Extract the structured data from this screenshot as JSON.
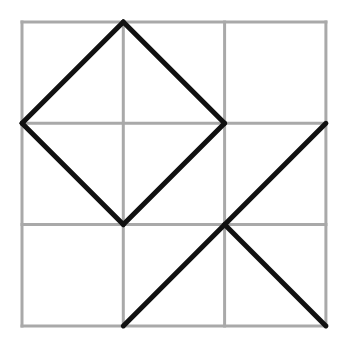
{
  "diagram": {
    "title": "",
    "grid": {
      "rows": 3,
      "cols": 3,
      "line_color": "#a9a9a9"
    },
    "segment_color": "#111111",
    "segments_grid_units": [
      {
        "name": "diamond-edge-top-left",
        "from": [
          0,
          1
        ],
        "to": [
          1,
          0
        ]
      },
      {
        "name": "diamond-edge-top-right",
        "from": [
          1,
          0
        ],
        "to": [
          2,
          1
        ]
      },
      {
        "name": "diamond-edge-bottom-right",
        "from": [
          2,
          1
        ],
        "to": [
          1,
          2
        ]
      },
      {
        "name": "diamond-edge-bottom-left",
        "from": [
          1,
          2
        ],
        "to": [
          0,
          1
        ]
      },
      {
        "name": "long-diagonal",
        "from": [
          1,
          3
        ],
        "to": [
          3,
          1
        ]
      },
      {
        "name": "short-diagonal",
        "from": [
          2,
          2
        ],
        "to": [
          3,
          3
        ]
      }
    ]
  }
}
